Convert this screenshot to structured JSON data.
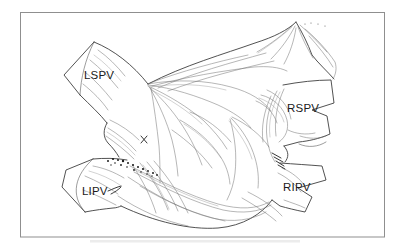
{
  "figure": {
    "labels": {
      "lspv": "LSPV",
      "rspv": "RSPV",
      "lipv": "LIPV",
      "ripv": "RIPV"
    },
    "colors": {
      "ink": "#4a4a4a",
      "ink_dark": "#1f1f1f",
      "frame_border": "#8f8f8f",
      "background": "#ffffff",
      "label_text": "#1b1b1b"
    }
  }
}
